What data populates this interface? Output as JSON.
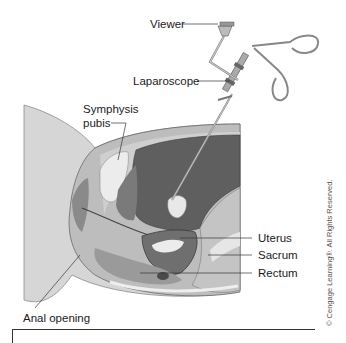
{
  "figure": {
    "type": "anatomical-illustration"
  },
  "labels": {
    "viewer": "Viewer",
    "laparoscope": "Laparoscope",
    "symphysis_pubis_line1": "Symphysis",
    "symphysis_pubis_line2": "pubis",
    "uterus": "Uterus",
    "sacrum": "Sacrum",
    "rectum": "Rectum",
    "anal_opening": "Anal opening"
  },
  "copyright": "© Cengage Learning®. All Rights Reserved.",
  "colors": {
    "outer_body": "#d4d4d4",
    "tissue_mid": "#b6b6b6",
    "abdominal_cavity": "#5e5e5e",
    "bone_highlight": "#ececec",
    "dark_organ": "#6f6f6f",
    "instrument": "#9a9a9a",
    "line": "#333333"
  }
}
